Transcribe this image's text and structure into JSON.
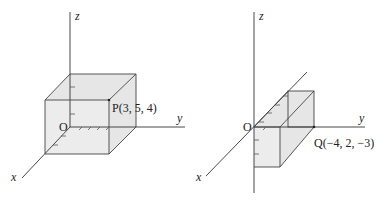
{
  "figures": [
    {
      "id": "left",
      "axes": {
        "x": "x",
        "y": "y",
        "z": "z"
      },
      "origin_label": "O",
      "point": {
        "name": "P",
        "coords": [
          3,
          5,
          4
        ],
        "label": "P(3, 5, 4)"
      }
    },
    {
      "id": "right",
      "axes": {
        "x": "x",
        "y": "y",
        "z": "z"
      },
      "origin_label": "O",
      "point": {
        "name": "Q",
        "coords": [
          -4,
          2,
          -3
        ],
        "label": "Q(−4, 2, −3)"
      }
    }
  ],
  "colors": {
    "face": "#e6e6e6",
    "line": "#333333"
  }
}
